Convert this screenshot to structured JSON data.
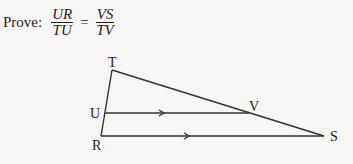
{
  "statement": {
    "prefix": "Prove:",
    "lhs": {
      "numerator": "UR",
      "denominator": "TU"
    },
    "equals": "=",
    "rhs": {
      "numerator": "VS",
      "denominator": "TV"
    }
  },
  "diagram": {
    "labels": {
      "T": "T",
      "U": "U",
      "V": "V",
      "R": "R",
      "S": "S"
    },
    "line_color": "#333333"
  }
}
